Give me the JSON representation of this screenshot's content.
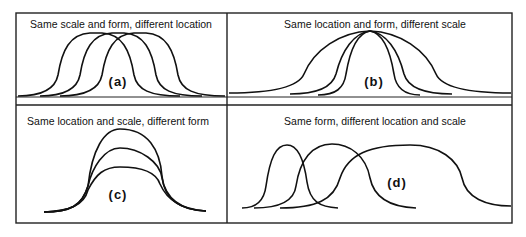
{
  "panels": [
    {
      "id": "a",
      "title": "Same scale and form, different location",
      "tag": "(a)"
    },
    {
      "id": "b",
      "title": "Same location and form, different scale",
      "tag": "(b)"
    },
    {
      "id": "c",
      "title": "Same location and scale, different form",
      "tag": "(c)"
    },
    {
      "id": "d",
      "title": "Same form, different location and scale",
      "tag": "(d)"
    }
  ],
  "colors": {
    "line": "#111111",
    "background": "#ffffff"
  }
}
